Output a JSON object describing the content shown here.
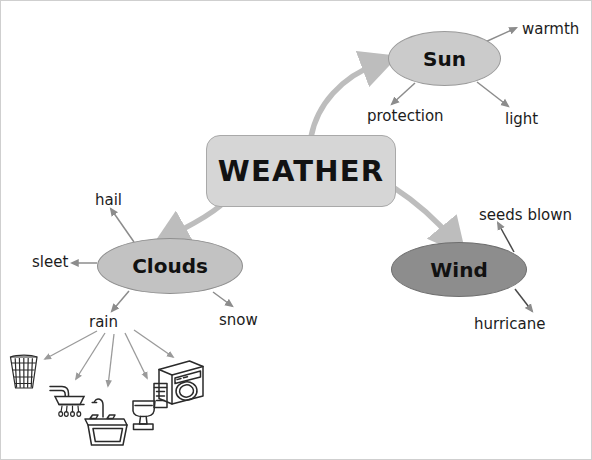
{
  "diagram": {
    "title": "WEATHER",
    "type": "concept-map",
    "background_color": "#ffffff",
    "center": {
      "label": "WEATHER",
      "shape": "rounded-rectangle",
      "fill": "#d6d6d6",
      "border": "#a9a9a9"
    },
    "branches": [
      {
        "id": "sun",
        "label": "Sun",
        "shape": "ellipse",
        "fill": "#cbcbcb",
        "border": "#9a9a9a",
        "children": [
          {
            "id": "warmth",
            "label": "warmth"
          },
          {
            "id": "protection",
            "label": "protection"
          },
          {
            "id": "light",
            "label": "light"
          }
        ]
      },
      {
        "id": "clouds",
        "label": "Clouds",
        "shape": "ellipse",
        "fill": "#c2c2c2",
        "border": "#8f8f8f",
        "children": [
          {
            "id": "hail",
            "label": "hail"
          },
          {
            "id": "sleet",
            "label": "sleet"
          },
          {
            "id": "rain",
            "label": "rain"
          },
          {
            "id": "snow",
            "label": "snow"
          }
        ]
      },
      {
        "id": "wind",
        "label": "Wind",
        "shape": "ellipse",
        "fill": "#8d8d8d",
        "border": "#6f6f6f",
        "children": [
          {
            "id": "seeds-blown",
            "label": "seeds blown"
          },
          {
            "id": "hurricane",
            "label": "hurricane"
          }
        ]
      }
    ],
    "rain_uses": [
      {
        "id": "bucket",
        "icon": "bucket-icon"
      },
      {
        "id": "shower",
        "icon": "shower-head-icon"
      },
      {
        "id": "sink",
        "icon": "sink-faucet-icon"
      },
      {
        "id": "toilet",
        "icon": "toilet-icon"
      },
      {
        "id": "washing-machine",
        "icon": "washing-machine-icon"
      }
    ],
    "edges": {
      "primary_color": "#bdbdbd",
      "secondary_color": "#8c8c8c"
    }
  }
}
